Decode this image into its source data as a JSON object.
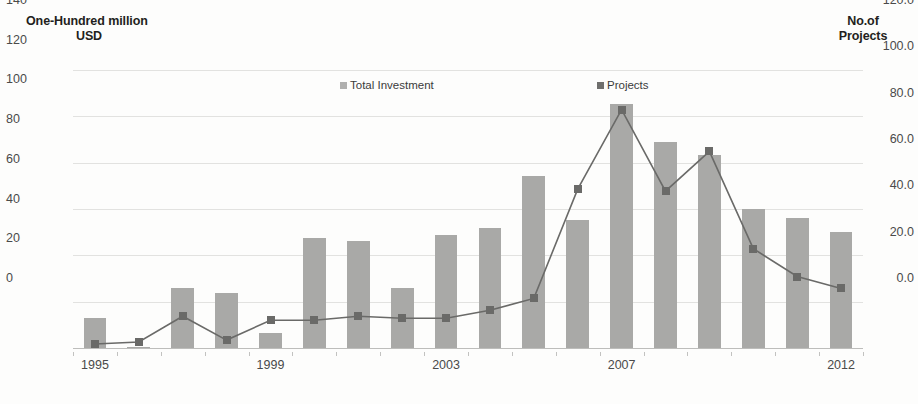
{
  "axes": {
    "left_title_line1": "One-Hundred million",
    "left_title_line2": "USD",
    "right_title_line1": "No.of",
    "right_title_line2": "Projects",
    "left_ticks": [
      "0.0",
      "20.0",
      "40.0",
      "60.0",
      "80.0",
      "100.0",
      "120.0"
    ],
    "right_ticks": [
      "0",
      "20",
      "40",
      "60",
      "80",
      "100",
      "120",
      "140"
    ],
    "x_labels": [
      {
        "label": "1995",
        "year": 1995
      },
      {
        "label": "1999",
        "year": 1999
      },
      {
        "label": "2003",
        "year": 2003
      },
      {
        "label": "2007",
        "year": 2007
      },
      {
        "label": "2012",
        "year": 2012
      }
    ]
  },
  "legend": {
    "investment_label": "Total Investment",
    "projects_label": "Projects",
    "investment_swatch": "bar-swatch-icon",
    "projects_swatch": "line-marker-icon"
  },
  "colors": {
    "bar": "#a9a9a7",
    "line": "#6a6a68",
    "marker": "#6a6a68",
    "grid": "#e2e2e0",
    "text": "#3b3b3b",
    "background": "#fdfdfc"
  },
  "chart_data": {
    "type": "bar",
    "title": "",
    "subtitle": "",
    "xlabel": "",
    "ylabel": "One-Hundred million USD",
    "y2label": "No.of Projects",
    "ylim": [
      0,
      120
    ],
    "y2lim": [
      0,
      140
    ],
    "grid": true,
    "legend_position": "top-center",
    "categories": [
      "1995",
      "1996",
      "1997",
      "1998",
      "1999",
      "2000",
      "2001",
      "2002",
      "2003",
      "2004",
      "2005",
      "2006",
      "2007",
      "2008",
      "2009",
      "2010",
      "2011",
      "2012"
    ],
    "series": [
      {
        "name": "Total Investment",
        "type": "bar",
        "axis": "left",
        "unit": "One-Hundred million USD",
        "values": [
          13.0,
          0.6,
          25.8,
          23.8,
          6.5,
          47.5,
          46.2,
          25.8,
          48.8,
          51.8,
          74.2,
          55.2,
          105.5,
          88.8,
          83.2,
          60.0,
          56.2,
          50.0
        ]
      },
      {
        "name": "Projects",
        "type": "line",
        "axis": "right",
        "unit": "No.of Projects",
        "values": [
          2,
          3,
          16,
          4,
          14,
          14,
          16,
          15,
          15,
          19,
          25,
          80,
          120,
          79,
          99,
          50,
          36,
          30
        ]
      }
    ]
  }
}
